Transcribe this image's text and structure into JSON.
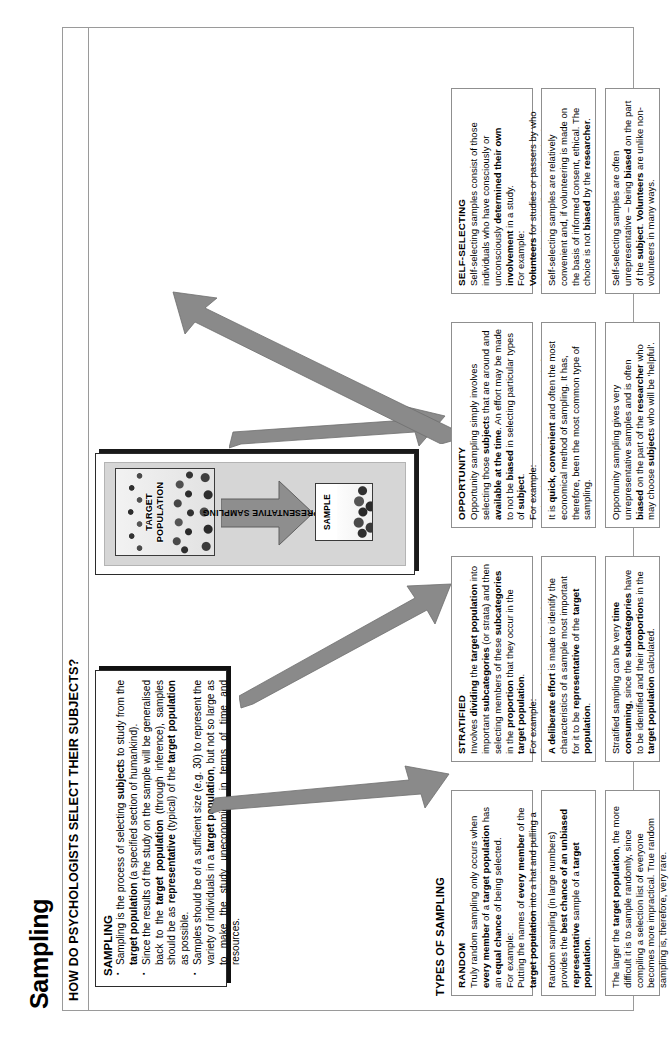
{
  "document": {
    "title": "Sampling",
    "section_heading": "HOW DO PSYCHOLOGISTS SELECT THEIR SUBJECTS?"
  },
  "sampling_panel": {
    "heading": "SAMPLING",
    "bullets": [
      "Sampling is the process of selecting subjects to study from the target population (a specified section of humankind).",
      "Since the results of the study on the sample will be generalised back to the target population (through inference), samples should be as representative (typical) of the target population as possible.",
      "Samples should be of a sufficient size (e.g. 30) to represent the variety of individuals in a target population, but not so large as to make the study uneconomical in terms of time and resources."
    ]
  },
  "diagram": {
    "population_label": "TARGET POPULATION",
    "sample_label": "SAMPLE",
    "arrow_label": "REPRESENTATIVE SAMPLING"
  },
  "row_labels": {
    "types": "TYPES OF SAMPLING",
    "strengths": "STRENGTHS",
    "weaknesses": "WEAKNESSES"
  },
  "columns": [
    {
      "key": "random",
      "heading": "RANDOM",
      "description": "Truly random sampling only occurs when every member of a target population has an equal chance of being selected.\nFor example:\nPutting the names of every member of the target population into a hat and pulling a sample out (without looking).",
      "strength": "Random sampling (in large numbers) provides the best chance of an unbiased representative sample of a target population.",
      "weakness": "The larger the target population, the more difficult it is to sample randomly, since compiling a selection list of everyone becomes more impractical. True random sampling is, therefore, very rare."
    },
    {
      "key": "stratified",
      "heading": "STRATIFIED",
      "description": "Involves dividing the target population into important subcategories (or strata) and then selecting members of these subcategories in the proportion that they occur in the target population.\nFor example:\nIf a target population consisted of 75% women and 25% men, a sample of 20 should include 15 women and 5 men.",
      "strength": "A deliberate effort is made to identify the characteristics of a sample most important for it to be representative of the target population.",
      "weakness": "Stratified sampling can be very time consuming, since the subcategories have to be identified and their proportions in the target population calculated."
    },
    {
      "key": "opportunity",
      "heading": "OPPORTUNITY",
      "description": "Opportunity sampling simply involves selecting those subjects that are around and available at the time. An effort may be made to not be biased in selecting particular types of subject.\nFor example:\nUniversity psychologists may sample from their students.",
      "strength": "It is quick, convenient and often the most economical method of sampling. It has, therefore, been the most common type of sampling.",
      "weakness": "Opportunity sampling gives very unrepresentative samples and is often biased on the part of the researcher who may choose subjects who will be 'helpful'."
    },
    {
      "key": "self-selecting",
      "heading": "SELF-SELECTING",
      "description": "Self-selecting samples consist of those individuals who have consciously or unconsciously determined their own involvement in a study.\nFor example:\nVolunteers for studies or passers by who become involved in field studies, i.e. in bystander intervention studies.",
      "strength": "Self-selecting samples are relatively convenient and, if volunteering is made on the basis of informed consent, ethical. The choice is not biased by the researcher.",
      "weakness": "Self-selecting samples are often unrepresentative – being biased on the part of the subject. Volunteers are unlike non-volunteers in many ways."
    }
  ],
  "colors": {
    "frame_border": "#9a9a9a",
    "cell_border": "#8f8f8f",
    "arrow_fill": "#8a8a8a",
    "shadow": "#111111",
    "diagram_panel": "#d6d6d6"
  }
}
